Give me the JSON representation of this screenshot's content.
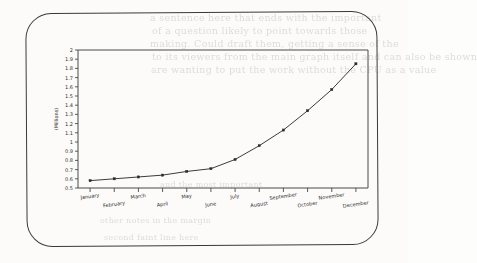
{
  "page": {
    "background_color": "#fcfbf9",
    "border_color": "#3a3a3a",
    "showthrough_lines": [
      "a sentence here that ends with the important",
      "of a question likely to point      towards those",
      "making. Could draft them, getting a sense of the",
      "to its viewers from the main graph itself and can also be shown",
      "are wanting to put the work without the CPU as a value"
    ],
    "showthrough_extra": [
      "and the most important",
      "other notes in the margin",
      "second faint line here"
    ]
  },
  "chart_data": {
    "type": "line",
    "title": "",
    "xlabel": "",
    "ylabel": "(Millions)",
    "categories": [
      "January",
      "February",
      "March",
      "April",
      "May",
      "June",
      "July",
      "August",
      "September",
      "October",
      "November",
      "December"
    ],
    "values": [
      0.58,
      0.6,
      0.62,
      0.64,
      0.68,
      0.71,
      0.81,
      0.96,
      1.13,
      1.34,
      1.57,
      1.85
    ],
    "ylim": [
      0.5,
      2.0
    ],
    "ytick_labels": [
      "2",
      "1.9",
      "1.8",
      "1.7",
      "1.6",
      "1.5",
      "1.4",
      "1.3",
      "1.2",
      "1.1",
      "1",
      "0.9",
      "0.8",
      "0.7",
      "0.6",
      "0.5"
    ],
    "ytick_values": [
      2,
      1.9,
      1.8,
      1.7,
      1.6,
      1.5,
      1.4,
      1.3,
      1.2,
      1.1,
      1,
      0.9,
      0.8,
      0.7,
      0.6,
      0.5
    ],
    "grid": false,
    "legend": "none",
    "marker": "square",
    "line_color": "#3c3c3c",
    "marker_color": "#2a2a2a",
    "axis_color": "#4a4a4a"
  }
}
